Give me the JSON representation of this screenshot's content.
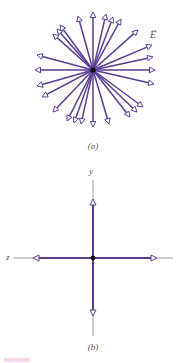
{
  "figure": {
    "panel_a": {
      "caption": "(a)",
      "vector_label": "E",
      "center": [
        93,
        70
      ],
      "arrow_color": "#5a3d96",
      "charge_color": "#111111",
      "arrow_tips": [
        [
          78,
          16
        ],
        [
          93,
          12
        ],
        [
          106,
          14
        ],
        [
          113,
          17
        ],
        [
          121,
          19
        ],
        [
          138,
          30
        ],
        [
          152,
          45
        ],
        [
          153,
          57
        ],
        [
          155,
          70
        ],
        [
          154,
          84
        ],
        [
          143,
          107
        ],
        [
          137,
          112
        ],
        [
          130,
          117
        ],
        [
          109,
          124
        ],
        [
          93,
          127
        ],
        [
          81,
          124
        ],
        [
          74,
          123
        ],
        [
          67,
          121
        ],
        [
          53,
          112
        ],
        [
          42,
          97
        ],
        [
          37,
          86
        ],
        [
          35,
          70
        ],
        [
          37,
          55
        ],
        [
          53,
          34
        ],
        [
          57,
          29
        ],
        [
          60,
          25
        ]
      ]
    },
    "panel_b": {
      "caption": "(b)",
      "y_axis_label": "y",
      "z_axis_label": "z",
      "center": [
        93,
        258
      ],
      "arrow_color": "#5a3d96",
      "axis_color": "#777777",
      "arrows": [
        {
          "direction": "up",
          "tip": [
            93,
            199
          ]
        },
        {
          "direction": "down",
          "tip": [
            93,
            316
          ]
        },
        {
          "direction": "left",
          "tip": [
            33,
            258
          ]
        },
        {
          "direction": "right",
          "tip": [
            157,
            258
          ]
        }
      ]
    }
  }
}
